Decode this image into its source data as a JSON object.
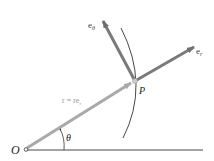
{
  "diagram": {
    "origin_label": "O",
    "point_label": "P",
    "angle_label": "θ",
    "position_vector_label": "r = re",
    "position_vector_sub": "r",
    "unit_r_label": "e",
    "unit_r_sub": "r",
    "unit_theta_label": "e",
    "unit_theta_sub": "θ",
    "colors": {
      "vector": "#7a7a7a",
      "position_vector": "#a9a9a9",
      "line": "#333333",
      "label_light": "#9a9a9a"
    }
  }
}
